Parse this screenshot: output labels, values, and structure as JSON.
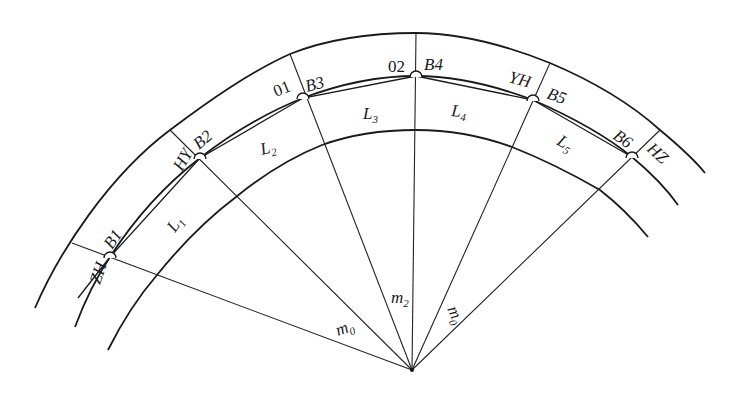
{
  "diagram": {
    "type": "curve-segmentation",
    "apex": {
      "x": 412,
      "y": 370
    },
    "points": [
      {
        "id": "B1",
        "label": "B1",
        "station": "ZH"
      },
      {
        "id": "B2",
        "label": "B2",
        "station": "HY"
      },
      {
        "id": "B3",
        "label": "B3",
        "station": "01"
      },
      {
        "id": "B4",
        "label": "B4",
        "station": "02"
      },
      {
        "id": "B5",
        "label": "B5",
        "station": "YH"
      },
      {
        "id": "B6",
        "label": "B6",
        "station": "HZ"
      }
    ],
    "segments": [
      {
        "label": "L",
        "sub": "1"
      },
      {
        "label": "L",
        "sub": "2"
      },
      {
        "label": "L",
        "sub": "3"
      },
      {
        "label": "L",
        "sub": "4"
      },
      {
        "label": "L",
        "sub": "5"
      }
    ],
    "radial_labels": [
      {
        "label": "m",
        "sub": "0"
      },
      {
        "label": "m",
        "sub": "2"
      },
      {
        "label": "m",
        "sub": "0"
      }
    ]
  }
}
